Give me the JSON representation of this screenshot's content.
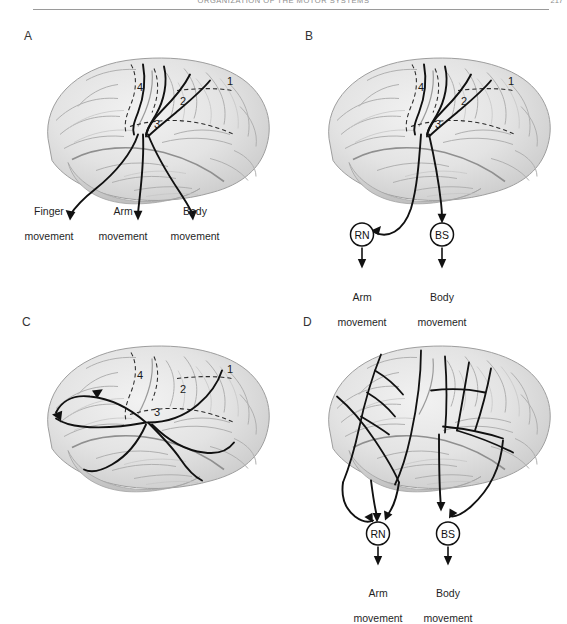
{
  "header": {
    "running_head": "ORGANIZATION OF THE MOTOR SYSTEMS",
    "folio": "217"
  },
  "figure": {
    "type": "four-panel-anatomical-diagram",
    "cortical_area_numbers": [
      "1",
      "2",
      "3",
      "4"
    ],
    "panels": [
      {
        "id": "A",
        "letter": "A",
        "description": "descending corticospinal projections from motor cortex to effectors",
        "area_numbers": [
          "1",
          "2",
          "3",
          "4"
        ],
        "outputs": [
          {
            "name": "finger",
            "line1": "Finger",
            "line2": "movement"
          },
          {
            "name": "arm",
            "line1": "Arm",
            "line2": "movement"
          },
          {
            "name": "body",
            "line1": "Body",
            "line2": "movement"
          }
        ],
        "relay_nodes": []
      },
      {
        "id": "B",
        "letter": "B",
        "description": "descending projections relayed through red nucleus and brain stem",
        "area_numbers": [
          "1",
          "2",
          "3",
          "4"
        ],
        "outputs": [
          {
            "name": "arm",
            "line1": "Arm",
            "line2": "movement"
          },
          {
            "name": "body",
            "line1": "Body",
            "line2": "movement"
          }
        ],
        "relay_nodes": [
          {
            "abbr": "RN",
            "target": "Arm movement"
          },
          {
            "abbr": "BS",
            "target": "Body movement"
          }
        ]
      },
      {
        "id": "C",
        "letter": "C",
        "description": "corticocortical association connections within the hemisphere",
        "area_numbers": [
          "1",
          "2",
          "3",
          "4"
        ],
        "outputs": [],
        "relay_nodes": []
      },
      {
        "id": "D",
        "letter": "D",
        "description": "distributed branching projections converging on red nucleus and brain stem",
        "area_numbers": [],
        "outputs": [
          {
            "name": "arm",
            "line1": "Arm",
            "line2": "movement"
          },
          {
            "name": "body",
            "line1": "Body",
            "line2": "movement"
          }
        ],
        "relay_nodes": [
          {
            "abbr": "RN",
            "target": "Arm movement"
          },
          {
            "abbr": "BS",
            "target": "Body movement"
          }
        ]
      }
    ],
    "colors": {
      "ink": "#111111",
      "brain_light": "#e9e9e9",
      "brain_mid": "#d2d2d2",
      "brain_dark": "#b4b4b4",
      "rule": "#9a9a9a",
      "header_text": "#8d8d8d"
    }
  }
}
